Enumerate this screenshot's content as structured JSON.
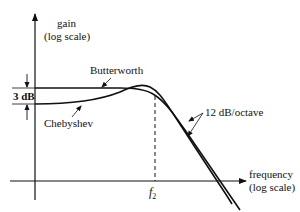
{
  "diagram": {
    "type": "filter-frequency-response",
    "y_axis": {
      "label_line1": "gain",
      "label_line2": "(log scale)"
    },
    "x_axis": {
      "label_line1": "frequency",
      "label_line2": "(log scale)"
    },
    "curves": [
      {
        "name": "Butterworth",
        "label": "Butterworth"
      },
      {
        "name": "Chebyshev",
        "label": "Chebyshev"
      }
    ],
    "ripple_label": "3 dB",
    "rolloff_label": "12 dB/octave",
    "cutoff": {
      "symbol": "f",
      "subscript": "2"
    }
  },
  "colors": {
    "ink": "#111111",
    "background": "#ffffff"
  }
}
